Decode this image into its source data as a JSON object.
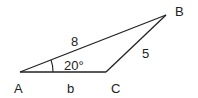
{
  "diagram": {
    "type": "triangle",
    "vertices": {
      "A": {
        "label": "A",
        "x": 20,
        "y": 72
      },
      "B": {
        "label": "B",
        "x": 166,
        "y": 15
      },
      "C": {
        "label": "C",
        "x": 106,
        "y": 72
      }
    },
    "sides": {
      "AB": {
        "label": "8"
      },
      "BC": {
        "label": "5"
      },
      "AC": {
        "label": "b"
      }
    },
    "angle_A": {
      "label": "20°"
    },
    "stroke_color": "#222222"
  }
}
